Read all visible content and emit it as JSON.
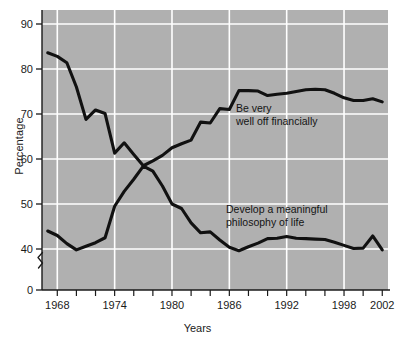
{
  "chart_data": {
    "type": "line",
    "title": "",
    "xlabel": "Years",
    "ylabel": "Percentage",
    "xlim": [
      1966.4,
      2002.6
    ],
    "ylim": [
      36.8,
      92.0
    ],
    "ylim_display": [
      0,
      92
    ],
    "y_axis_break": true,
    "y_break_between": [
      0,
      40
    ],
    "grid": true,
    "grid_color": "#ffffff",
    "plot_background": "#b0b0b0",
    "line_color": "#111111",
    "legend": "inline-annotations",
    "yticks": [
      0,
      40,
      50,
      60,
      70,
      80,
      90
    ],
    "ytick_labels": [
      "0",
      "40",
      "50",
      "60",
      "70",
      "80",
      "90"
    ],
    "xticks_major": [
      1968,
      1974,
      1980,
      1986,
      1992,
      1998,
      2002
    ],
    "xtick_labels": [
      "1968",
      "1974",
      "1980",
      "1986",
      "1992",
      "1998",
      "2002"
    ],
    "xticks_minor": [
      1968,
      1970,
      1972,
      1974,
      1976,
      1978,
      1980,
      1982,
      1984,
      1986,
      1988,
      1990,
      1992,
      1994,
      1996,
      1998,
      2000,
      2002
    ],
    "x": [
      1967,
      1968,
      1969,
      1970,
      1971,
      1972,
      1973,
      1974,
      1975,
      1976,
      1977,
      1978,
      1979,
      1980,
      1981,
      1982,
      1983,
      1984,
      1985,
      1986,
      1987,
      1988,
      1989,
      1990,
      1991,
      1992,
      1993,
      1994,
      1995,
      1996,
      1997,
      1998,
      1999,
      2000,
      2001,
      2002
    ],
    "series": [
      {
        "name": "Be very well off financially",
        "label_line1": "Be very",
        "label_line2": "well off financially",
        "values": [
          44.0,
          43.0,
          41.2,
          39.8,
          40.6,
          41.4,
          42.5,
          49.5,
          52.8,
          55.5,
          58.4,
          57.3,
          54.0,
          50.0,
          49.0,
          45.8,
          43.6,
          43.8,
          42.0,
          40.4,
          39.6,
          40.5,
          41.3,
          42.3,
          42.4,
          42.8,
          42.4,
          42.3,
          42.2,
          42.1,
          41.5,
          40.8,
          40.1,
          40.2,
          42.9,
          39.8
        ]
      },
      {
        "name": "Develop a meaningful philosophy of life",
        "label_line1": "Develop a meaningful",
        "label_line2": "philosophy of life",
        "values": [
          83.6,
          82.8,
          81.4,
          76.0,
          68.8,
          70.9,
          70.1,
          61.3,
          63.6,
          61.0,
          58.5,
          59.6,
          60.8,
          62.5,
          63.4,
          64.2,
          68.2,
          68.0,
          71.2,
          71.0,
          75.2,
          75.2,
          75.1,
          74.1,
          74.4,
          74.6,
          75.0,
          75.4,
          75.5,
          75.4,
          74.6,
          73.6,
          73.0,
          73.0,
          73.4,
          72.7
        ]
      }
    ],
    "annotations": [
      {
        "id": "annotation-be-well-off",
        "line1": "Be very",
        "line2": "well off financially",
        "x_px": 236,
        "y_px": 112
      },
      {
        "id": "annotation-philosophy",
        "line1": "Develop a meaningful",
        "line2": "philosophy of life",
        "x_px": 226,
        "y_px": 213
      }
    ]
  },
  "axes": {
    "y_title": "Percentage",
    "x_title": "Years"
  }
}
